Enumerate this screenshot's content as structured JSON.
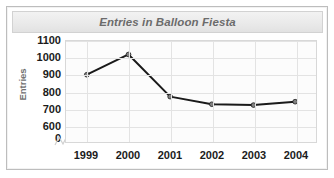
{
  "chart_data": {
    "type": "line",
    "title": "Entries in Balloon Fiesta",
    "xlabel": "",
    "ylabel": "Entries",
    "categories": [
      "1999",
      "2000",
      "2001",
      "2002",
      "2003",
      "2004"
    ],
    "values": [
      900,
      1020,
      770,
      725,
      720,
      740
    ],
    "series": [
      {
        "name": "Entries",
        "values": [
          900,
          1020,
          770,
          725,
          720,
          740
        ]
      }
    ],
    "ytick_labels": [
      "1100",
      "1000",
      "900",
      "800",
      "700",
      "600",
      "0"
    ],
    "ytick_values": [
      1100,
      1000,
      900,
      800,
      700,
      600,
      0
    ],
    "ylim": [
      600,
      1100
    ],
    "axis_break": true,
    "grid": {
      "horizontal": true,
      "vertical": true
    },
    "legend": "none",
    "marker": "circle",
    "colors": {
      "line": "#1a1a1a",
      "marker_fill": "#808080",
      "grid": "#e3e3e3",
      "title_text": "#6b6b6b",
      "axis_label_text": "#707070",
      "tick_text": "#1b1b1b",
      "plot_background": "#fcfcfc",
      "title_band_background": "#eaeaea",
      "frame_border": "#bdbdbd"
    }
  }
}
